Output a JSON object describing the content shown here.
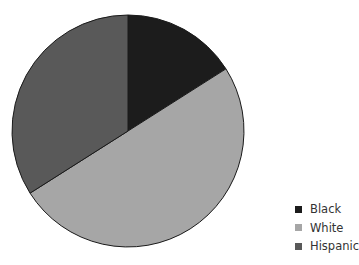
{
  "chart_data": {
    "type": "pie",
    "title": "",
    "categories": [
      "Black",
      "White",
      "Hispanic"
    ],
    "values": [
      16,
      50,
      34
    ],
    "unit": "percent (estimated from slice angles)",
    "colors": [
      "#1c1c1c",
      "#a6a6a6",
      "#595959"
    ],
    "start_angle": "12 o'clock, clockwise",
    "legend_position": "bottom-right"
  },
  "legend": {
    "items": [
      {
        "label": "Black",
        "color": "#1c1c1c"
      },
      {
        "label": "White",
        "color": "#a6a6a6"
      },
      {
        "label": "Hispanic",
        "color": "#595959"
      }
    ]
  }
}
